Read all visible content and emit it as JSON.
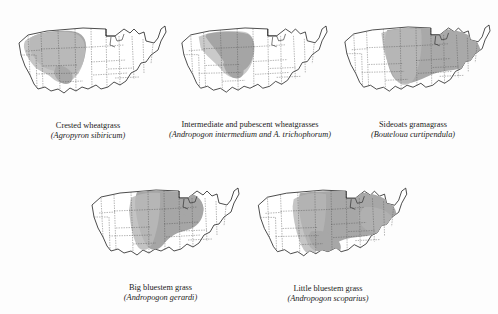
{
  "page": {
    "clipped_header_text": "GRASSES OF THE UNITED STATES",
    "background_color": "#fdfdfd",
    "shade_color": "#a8a8a8",
    "outline_color": "#111111",
    "state_border_color": "#4d4d4d"
  },
  "figure": {
    "type": "distribution-map-grid",
    "map_subject": "United States",
    "rows": [
      3,
      2
    ],
    "maps": [
      {
        "id": "crested-wheatgrass",
        "common_name": "Crested wheatgrass",
        "latin_name": "(Agropyron sibiricum)",
        "range_description": "Northern Rocky Mountains and northern Great Plains",
        "shade_color": "#a8a8a8"
      },
      {
        "id": "intermediate-pubescent-wheatgrasses",
        "common_name": "Intermediate and pubescent wheatgrasses",
        "latin_name": "(Andropogon intermedium and A. trichophorum)",
        "range_description": "Northern Great Plains and northern Rockies",
        "shade_color": "#a8a8a8"
      },
      {
        "id": "sideoats-gramagrass",
        "common_name": "Sideoats gramagrass",
        "latin_name": "(Bouteloua curtipendula)",
        "range_description": "Great Plains east through the Midwest and mid-Atlantic",
        "shade_color": "#a8a8a8"
      },
      {
        "id": "big-bluestem-grass",
        "common_name": "Big bluestem grass",
        "latin_name": "(Andropogon gerardi)",
        "range_description": "Tallgrass prairie from the Dakotas to Texas and east to Ohio",
        "shade_color": "#a8a8a8"
      },
      {
        "id": "little-bluestem-grass",
        "common_name": "Little bluestem grass",
        "latin_name": "(Andropogon scoparius)",
        "range_description": "Central and eastern United States from the Plains to the Appalachians",
        "shade_color": "#a8a8a8"
      }
    ]
  }
}
